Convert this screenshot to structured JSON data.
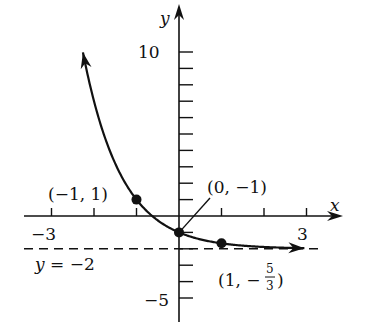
{
  "chart_data": {
    "type": "line",
    "title": "",
    "function": "y = 3^(-x) - 2",
    "xlabel": "x",
    "ylabel": "y",
    "xlim": [
      -3.5,
      3.8
    ],
    "ylim": [
      -6,
      11.5
    ],
    "x_ticks": [
      -3,
      -2,
      -1,
      0,
      1,
      2,
      3
    ],
    "x_tick_labels": [
      {
        "value": -3,
        "text": "−3"
      },
      {
        "value": 3,
        "text": "3"
      }
    ],
    "y_ticks": [
      -5,
      -4,
      -3,
      -2,
      -1,
      1,
      2,
      3,
      4,
      5,
      6,
      7,
      8,
      9,
      10
    ],
    "y_tick_labels": [
      {
        "value": 10,
        "text": "10"
      },
      {
        "value": -5,
        "text": "−5"
      }
    ],
    "asymptote": {
      "y": -2,
      "label": "y = −2",
      "style": "dashed"
    },
    "points": [
      {
        "x": -1,
        "y": 1,
        "label": "(−1, 1)"
      },
      {
        "x": 0,
        "y": -1,
        "label": "(0, −1)"
      },
      {
        "x": 1,
        "y": -1.6667,
        "label_prefix": "(1, −",
        "label_num": "5",
        "label_den": "3",
        "label_suffix": ")"
      }
    ],
    "curve_domain": [
      -2.26,
      2.95
    ],
    "grid": false,
    "legend": null
  },
  "layout": {
    "origin_px": [
      179,
      216
    ],
    "px_per_x": 42.5,
    "px_per_y": 16.4,
    "x_axis_px": [
      24,
      343
    ],
    "y_axis_px": [
      322,
      4
    ],
    "asymptote_px": [
      24,
      324
    ],
    "color": "#111111"
  }
}
